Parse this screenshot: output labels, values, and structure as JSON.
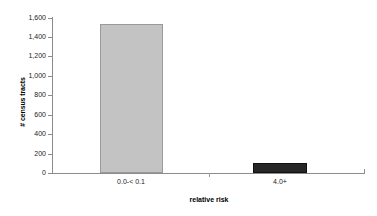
{
  "chart_data": {
    "type": "bar",
    "title": "",
    "subtitle": "",
    "xlabel": "relative risk",
    "ylabel": "# census tracts",
    "categories": [
      "0.0-< 0.1",
      "4.0+"
    ],
    "values": [
      1540,
      100
    ],
    "series": [
      {
        "name": "# census tracts",
        "values": [
          1540,
          100
        ],
        "colors": [
          "#c3c3c3",
          "#262626"
        ]
      }
    ],
    "ylim": [
      0,
      1600
    ],
    "yticks": [
      0,
      200,
      400,
      600,
      800,
      1000,
      1200,
      1400,
      1600
    ],
    "ytick_labels": [
      "0",
      "200",
      "400",
      "600",
      "800",
      "1,000",
      "1,200",
      "1,400",
      "1,600"
    ],
    "grid": false,
    "legend": false,
    "legend_position": "none",
    "bar_colors": {
      "category_0": "#c3c3c3",
      "category_1": "#262626"
    },
    "axis_color": "#8c8c8c",
    "background": "#ffffff"
  },
  "axes": {
    "y_title": "# census tracts",
    "x_title": "relative risk"
  },
  "ticks": {
    "y": [
      {
        "label": "1,600",
        "value": 1600
      },
      {
        "label": "1,400",
        "value": 1400
      },
      {
        "label": "1,200",
        "value": 1200
      },
      {
        "label": "1,000",
        "value": 1000
      },
      {
        "label": "800",
        "value": 800
      },
      {
        "label": "600",
        "value": 600
      },
      {
        "label": "400",
        "value": 400
      },
      {
        "label": "200",
        "value": 200
      },
      {
        "label": "0",
        "value": 0
      }
    ],
    "x": [
      {
        "label": "0.0-< 0.1"
      },
      {
        "label": "4.0+"
      }
    ]
  }
}
